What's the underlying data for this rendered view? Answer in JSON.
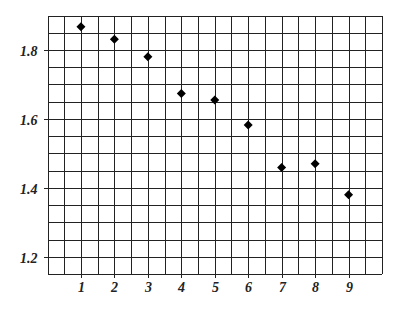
{
  "chart_data": {
    "type": "scatter",
    "title": "",
    "xlabel": "",
    "ylabel": "",
    "xlim": [
      0,
      10
    ],
    "ylim": [
      1.15,
      1.9
    ],
    "grid": true,
    "grid_step_x": 0.5,
    "grid_step_y": 0.05,
    "marker": "diamond",
    "x_ticks": [
      1,
      2,
      3,
      4,
      5,
      6,
      7,
      8,
      9
    ],
    "x_tick_labels": [
      "1",
      "2",
      "3",
      "4",
      "5",
      "6",
      "7",
      "8",
      "9"
    ],
    "y_ticks": [
      1.2,
      1.4,
      1.6,
      1.8
    ],
    "y_tick_labels": [
      "1.2",
      "1.4",
      "1.6",
      "1.8"
    ],
    "series": [
      {
        "name": "data",
        "x": [
          1,
          2,
          3,
          4,
          5,
          6,
          7,
          8,
          9
        ],
        "y": [
          1.867,
          1.831,
          1.78,
          1.674,
          1.655,
          1.582,
          1.459,
          1.47,
          1.38
        ]
      }
    ],
    "colors": {
      "grid": "#222222",
      "marker": "#000000",
      "background": "#ffffff"
    }
  }
}
